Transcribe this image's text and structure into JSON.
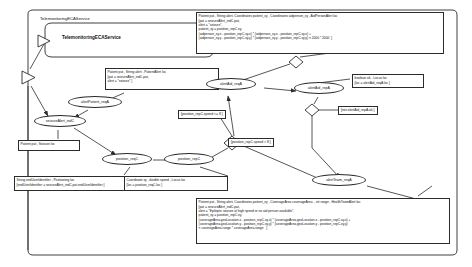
{
  "diagram": {
    "title": "TelemonitoringECAService",
    "outer_frame_label": "TelemonitoringECAService",
    "service_box": {
      "name": "TelemonitoringECAService",
      "keyword": "is"
    },
    "nodes": [
      {
        "id": "alertPatient_reqA",
        "label": "alertPatient_reqA"
      },
      {
        "id": "seizureAlert_indC",
        "label": "seizureAlert_indC"
      },
      {
        "id": "position_reqC",
        "label": "position_reqC"
      },
      {
        "id": "position_repC",
        "label": "position_repC"
      },
      {
        "id": "alertAid_reqA",
        "label": "alertAid_reqA"
      },
      {
        "id": "alertAid_repA",
        "label": "alertAid_repA"
      },
      {
        "id": "alertTeam_reqA",
        "label": "alertTeam_reqA"
      }
    ],
    "notes": [
      {
        "id": "note-aidperson",
        "text": "Patient pat , String alert, Coordinates patient_xy , Coordinates aidperson_xy , AidPersonAlert loc\n[pat = seizureAlert_indC.pat,\nalert = \"seizure\",\npatient_xy = position_repC.xy,\n(aidperson_xy.x - position_repC.xy.x) * (aidperson_xy.x - position_repC.xy.x) +\n(aidperson_xy.y - position_repC.xy.y) * (aidperson_xy.y - position_repC.xy.y) < 2000 * 2000  ]"
      },
      {
        "id": "note-patientalert",
        "text": "Patient pat , String alert , PatientAlert loc\n[pat = seizureAlert_indC.pat,\nalert = \"seizure\" ]"
      },
      {
        "id": "note-boolean-ok",
        "text": "boolean ok , Locus loc\n[loc = alertAid_reqA.loc ]"
      },
      {
        "id": "note-patient-seizure",
        "text": "Patient pat , Seizure loc"
      },
      {
        "id": "note-enduser",
        "text": "String endUserIdentifier , Positioning loc\n[endUserIdentifier = seizureAlert_indC.pat.endUserIdentifier ]"
      },
      {
        "id": "note-coordinate",
        "text": "Coordinate xy , double speed , Locus loc\n[loc = position_reqC.loc ]"
      },
      {
        "id": "note-healthteam",
        "text": "Patient pat , String alert, Coordinates patient_xy , CoverageArea coverageArea  , int range , HealthTeamAlert loc\n[pat = seizureAlert_indC.pat,\nalert = \"Epileptic seizure at high speed or no aid person available\",\npatient_xy = position_repC.xy,\n(coverageArea.geoLocation.x - position_repC.xy.x) * (coverageArea.geoLocation.x - position_repC.xy.x) +\n(coverageArea.geoLocation.y - position_repC.xy.y) * (coverageArea.geoLocation.y - position_repC.xy.y)\n< coverageArea.range * coverageArea.range   ]"
      }
    ],
    "guards": [
      {
        "id": "guard-speed-le",
        "text": "[position_repC.speed <= 8 ]"
      },
      {
        "id": "guard-speed-gt",
        "text": "[position_repC.speed > 8 ]"
      },
      {
        "id": "guard-not-ok",
        "text": "[not alertAid_repA.ok ]"
      }
    ],
    "colors": {
      "line": "#2b2b2b",
      "background": "#ffffff",
      "text": "#111111"
    }
  }
}
